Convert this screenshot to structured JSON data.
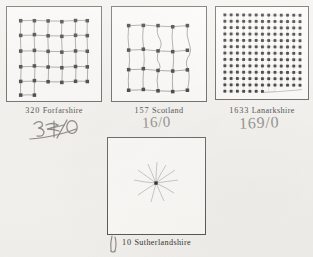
{
  "page": {
    "background_color": "#f3f1ed",
    "ink_color": "#2f2d2b",
    "pencil_color": "#6f6c68"
  },
  "figures": [
    {
      "id": "forfarshire",
      "number": "320",
      "name": "Forfarshire",
      "annotation": "3/0",
      "annotation_note": "crossed-out pencil fraction",
      "diagram": "lattice-grid-connected",
      "columns": 6,
      "rows": 5,
      "partial_last_row": 2,
      "dot_count": 32,
      "edges": "orthogonal hand-drawn"
    },
    {
      "id": "scotland",
      "number": "157",
      "name": "Scotland",
      "annotation": "16/0",
      "diagram": "lattice-grid-connected",
      "columns": 4,
      "rows": 4,
      "partial_last_row": 0,
      "dot_count": 16,
      "edges": "wavy hand-drawn"
    },
    {
      "id": "lanarkshire",
      "number": "1633",
      "name": "Lanarkshire",
      "annotation": "169/0",
      "diagram": "dense-dot-lattice",
      "columns": 13,
      "rows": 13,
      "partial_last_row": 7,
      "dot_count": 163,
      "edges": "none"
    },
    {
      "id": "sutherlandshire",
      "number": "10",
      "name": "Sutherlandshire",
      "annotation": "",
      "diagram": "single-node-starburst",
      "columns": 1,
      "rows": 1,
      "partial_last_row": 0,
      "dot_count": 1,
      "rays": 10,
      "edges": "radiating"
    }
  ]
}
